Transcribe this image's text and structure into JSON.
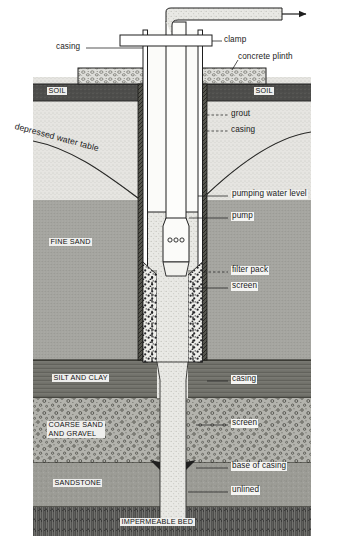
{
  "diagram": {
    "type": "engineering-cross-section"
  },
  "callouts": {
    "casing_top": "casing",
    "clamp": "clamp",
    "concrete_plinth": "concrete plinth",
    "grout": "grout",
    "casing_upper": "casing",
    "pumping_water_level": "pumping water level",
    "pump": "pump",
    "filter_pack": "filter pack",
    "screen_upper": "screen",
    "casing_lower": "casing",
    "screen_lower": "screen",
    "base_of_casing": "base of casing",
    "unlined": "unlined",
    "depressed_water_table": "depressed  water  table"
  },
  "strata": [
    {
      "name": "soil-left",
      "label": "SOIL"
    },
    {
      "name": "soil-right",
      "label": "SOIL"
    },
    {
      "name": "fine-sand",
      "label": "FINE SAND"
    },
    {
      "name": "silt-and-clay",
      "label": "SILT AND CLAY"
    },
    {
      "name": "coarse-sand-gravel",
      "label": "COARSE SAND\nAND GRAVEL"
    },
    {
      "name": "coarse-sand-line1",
      "label": "COARSE SAND"
    },
    {
      "name": "coarse-sand-line2",
      "label": "AND GRAVEL"
    },
    {
      "name": "sandstone",
      "label": "SANDSTONE"
    },
    {
      "name": "impermeable-bed",
      "label": "IMPERMEABLE BED"
    }
  ],
  "colors": {
    "line": "#1f1f1f",
    "soil_dark": "#4a4a4a",
    "unsaturated": "#e3e2de",
    "saturated": "#9e9e99",
    "fine_sand": "#a3a39e",
    "silt_clay": "#7d7d78",
    "coarse_sand": "#b0b0aa",
    "sandstone": "#9a9a95",
    "impermeable": "#3a3a3a",
    "grout": "#5d5d58",
    "water": "#f0efec",
    "plinth": "#dcdcd8",
    "label_bg": "#f0f0ee"
  },
  "flow": {
    "discharge_arrow": "▶"
  }
}
